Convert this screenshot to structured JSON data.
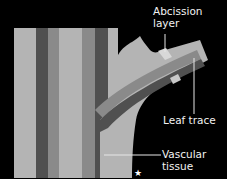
{
  "diagram": {
    "type": "botanical cross-section",
    "colors": {
      "background": "#000000",
      "tissue_light": "#b4b4b4",
      "tissue_medium": "#8a8a8a",
      "tissue_dark": "#505050",
      "abscission_layer": "#d8d8d8",
      "label_text": "#f2f2f2",
      "leader_line": "#e6e6e6"
    },
    "labels": {
      "abscission": "Abcission\nlayer",
      "leaf_trace": "Leaf trace",
      "vascular": "Vascular\ntissue"
    },
    "marker": "★"
  }
}
